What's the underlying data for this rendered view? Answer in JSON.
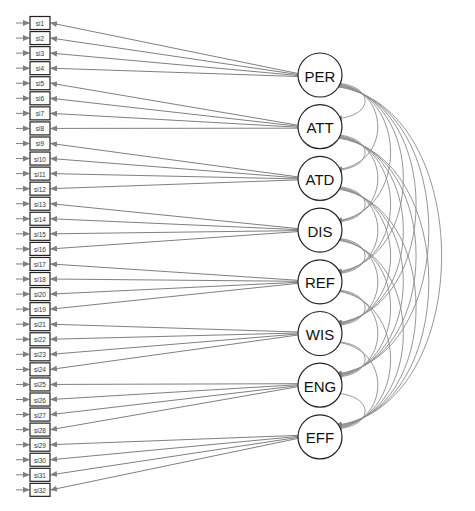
{
  "diagram": {
    "type": "structural equation model path diagram",
    "colors": {
      "edge": "#808080",
      "node_stroke": "#222222",
      "background": "#ffffff"
    },
    "latent_factors": [
      {
        "id": "PER",
        "label": "PER",
        "indicators": [
          "si1",
          "si2",
          "si3",
          "si4"
        ]
      },
      {
        "id": "ATT",
        "label": "ATT",
        "indicators": [
          "si5",
          "si6",
          "si7",
          "si8"
        ]
      },
      {
        "id": "ATD",
        "label": "ATD",
        "indicators": [
          "si9",
          "si10",
          "si11",
          "si12"
        ]
      },
      {
        "id": "DIS",
        "label": "DIS",
        "indicators": [
          "si13",
          "si14",
          "si15",
          "si16"
        ]
      },
      {
        "id": "REF",
        "label": "REF",
        "indicators": [
          "si17",
          "si18",
          "si20",
          "si19"
        ]
      },
      {
        "id": "WIS",
        "label": "WIS",
        "indicators": [
          "si21",
          "si22",
          "si23",
          "si24"
        ]
      },
      {
        "id": "ENG",
        "label": "ENG",
        "indicators": [
          "si25",
          "si26",
          "si27",
          "si28"
        ]
      },
      {
        "id": "EFF",
        "label": "EFF",
        "indicators": [
          "si29",
          "si30",
          "si31",
          "si32"
        ]
      }
    ],
    "indicators": [
      "si1",
      "si2",
      "si3",
      "si4",
      "si5",
      "si6",
      "si7",
      "si8",
      "si9",
      "si10",
      "si11",
      "si12",
      "si13",
      "si14",
      "si15",
      "si16",
      "si17",
      "si18",
      "si20",
      "si19",
      "si21",
      "si22",
      "si23",
      "si24",
      "si25",
      "si26",
      "si27",
      "si28",
      "si29",
      "si30",
      "si31",
      "si32"
    ],
    "covariances": "all pairs of latent factors (28 curved double-headed arrows)",
    "residual_arrows": "one short error arrow pointing into each indicator from the left"
  }
}
